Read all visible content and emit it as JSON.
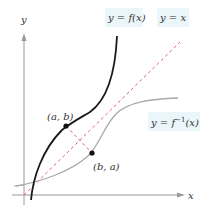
{
  "figure": {
    "axes": {
      "x_label": "x",
      "y_label": "y"
    },
    "curves": {
      "f": {
        "label_prefix": "y = ",
        "label_fn": "f",
        "label_arg": "(x)",
        "color": "#1a1a1a"
      },
      "identity": {
        "label": "y = x",
        "color": "#e06060"
      },
      "f_inverse": {
        "label_prefix": "y = ",
        "label_fn": "f",
        "label_sup": "−1",
        "label_arg": "(x)",
        "color": "#a0a0a0"
      }
    },
    "points": {
      "a_b": {
        "label": "(a, b)"
      },
      "b_a": {
        "label": "(b, a)"
      }
    },
    "label_box_color": "#eaf6fa"
  }
}
